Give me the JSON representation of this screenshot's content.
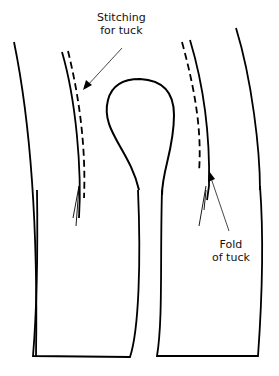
{
  "diagram": {
    "labels": {
      "stitching_line1": "Stitching",
      "stitching_line2": "for tuck",
      "fold_line1": "Fold",
      "fold_line2": "of tuck"
    },
    "colors": {
      "stroke": "#000000",
      "leader": "#333333",
      "background": "#ffffff"
    }
  }
}
